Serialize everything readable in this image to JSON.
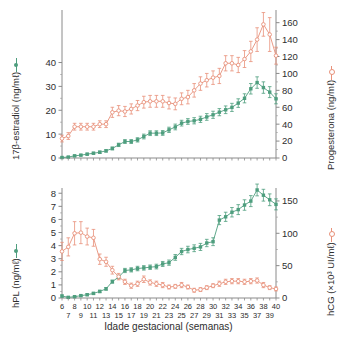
{
  "figure": {
    "xaxis_title": "Idade gestacional (semanas)",
    "x_ticks_even": [
      "6",
      "8",
      "10",
      "12",
      "14",
      "16",
      "18",
      "20",
      "22",
      "24",
      "26",
      "28",
      "30",
      "32",
      "34",
      "36",
      "38",
      "40"
    ],
    "x_ticks_odd": [
      "7",
      "9",
      "11",
      "13",
      "15",
      "17",
      "19",
      "21",
      "23",
      "25",
      "27",
      "29",
      "31",
      "33",
      "35",
      "37",
      "39"
    ],
    "colors": {
      "green": "#4e9e7e",
      "salmon": "#e8917a",
      "axis": "#8a8a8a",
      "text": "#2e2e2e",
      "background": "#ffffff"
    }
  },
  "panels": {
    "top": {
      "left_axis_title": "17β-estradiol (ng/mℓ)",
      "left_ticks": [
        "0",
        "10",
        "20",
        "30",
        "40"
      ],
      "right_axis_title": "Progesterona (ng/mℓ)",
      "right_ticks": [
        "0",
        "20",
        "40",
        "60",
        "80",
        "100",
        "120",
        "140",
        "160"
      ]
    },
    "bottom": {
      "left_axis_title": "hPL (ng/mℓ)",
      "left_ticks": [
        "0",
        "1",
        "2",
        "3",
        "4",
        "5",
        "6",
        "7",
        "8"
      ],
      "right_axis_title": "hCG (×10³ UI/mℓ)",
      "right_ticks": [
        "0",
        "50",
        "100",
        "150"
      ]
    }
  },
  "chart_data": [
    {
      "type": "line",
      "id": "top-panel",
      "title": "",
      "xlabel": "Idade gestacional (semanas)",
      "xlim": [
        6,
        40
      ],
      "grid": false,
      "legend": "axis-titles",
      "series": [
        {
          "name": "17β-estradiol (ng/mℓ)",
          "color": "#4e9e7e",
          "axis": "left",
          "ylabel": "17β-estradiol (ng/mℓ)",
          "ylim": [
            0,
            62
          ],
          "x": [
            6,
            7,
            8,
            9,
            10,
            11,
            12,
            13,
            14,
            15,
            16,
            17,
            18,
            19,
            20,
            21,
            22,
            23,
            24,
            25,
            26,
            27,
            28,
            29,
            30,
            31,
            32,
            33,
            34,
            35,
            36,
            37,
            38,
            39,
            40
          ],
          "values": [
            0.2,
            0.4,
            0.9,
            1.2,
            1.6,
            2.0,
            2.4,
            3.0,
            4.0,
            5.5,
            6.9,
            6.9,
            7.6,
            9.0,
            10.4,
            10.4,
            10.5,
            11.8,
            13.0,
            14.6,
            15.3,
            15.6,
            16.2,
            17.2,
            18.1,
            19.2,
            20.2,
            21.2,
            23.0,
            25.0,
            29.0,
            31.6,
            29.5,
            27.6,
            24.8
          ],
          "errors": [
            0.2,
            0.2,
            0.3,
            0.3,
            0.4,
            0.4,
            0.5,
            0.5,
            0.6,
            0.7,
            0.8,
            0.8,
            0.9,
            1.0,
            1.0,
            1.0,
            1.0,
            1.1,
            1.2,
            1.2,
            1.2,
            1.3,
            1.3,
            1.4,
            1.5,
            1.5,
            1.6,
            1.7,
            1.8,
            1.9,
            2.2,
            2.4,
            2.4,
            2.3,
            2.1
          ]
        },
        {
          "name": "Progesterona (ng/mℓ)",
          "color": "#e8917a",
          "axis": "right",
          "ylabel": "Progesterona (ng/mℓ)",
          "ylim": [
            0,
            175
          ],
          "x": [
            6,
            7,
            8,
            9,
            10,
            11,
            12,
            13,
            14,
            15,
            16,
            17,
            18,
            19,
            20,
            21,
            22,
            23,
            24,
            25,
            26,
            27,
            28,
            29,
            30,
            31,
            32,
            33,
            34,
            35,
            36,
            37,
            38,
            39,
            40
          ],
          "values": [
            23,
            26,
            37,
            37,
            37,
            37,
            40,
            40,
            54,
            56,
            55,
            58,
            62,
            66,
            67,
            67,
            67,
            65,
            64,
            70,
            72,
            80,
            88,
            92,
            95,
            97,
            112,
            112,
            110,
            117,
            126,
            140,
            158,
            146,
            121
          ],
          "errors": [
            4,
            4,
            4,
            4,
            4,
            4,
            4,
            4,
            6,
            6,
            6,
            6,
            6,
            7,
            7,
            7,
            7,
            7,
            7,
            7,
            8,
            8,
            8,
            8,
            8,
            9,
            9,
            9,
            9,
            10,
            12,
            14,
            14,
            20,
            10
          ]
        }
      ]
    },
    {
      "type": "line",
      "id": "bottom-panel",
      "title": "",
      "xlabel": "Idade gestacional (semanas)",
      "xlim": [
        6,
        40
      ],
      "grid": false,
      "legend": "axis-titles",
      "series": [
        {
          "name": "hPL (ng/mℓ)",
          "color": "#4e9e7e",
          "axis": "left",
          "ylabel": "hPL (ng/mℓ)",
          "ylim": [
            0,
            8.4
          ],
          "x": [
            6,
            7,
            8,
            9,
            10,
            11,
            12,
            13,
            14,
            15,
            16,
            17,
            18,
            19,
            20,
            21,
            22,
            23,
            24,
            25,
            26,
            27,
            28,
            29,
            30,
            31,
            32,
            33,
            34,
            35,
            36,
            37,
            38,
            39,
            40
          ],
          "values": [
            0.15,
            0.05,
            0.1,
            0.18,
            0.25,
            0.35,
            0.5,
            0.7,
            1.25,
            1.6,
            2.1,
            2.15,
            2.25,
            2.3,
            2.35,
            2.4,
            2.6,
            2.7,
            3.1,
            3.55,
            3.7,
            3.8,
            3.9,
            4.2,
            4.3,
            5.95,
            6.2,
            6.55,
            6.75,
            7.1,
            7.4,
            8.25,
            7.85,
            7.5,
            7.15
          ],
          "errors": [
            0.08,
            0.05,
            0.05,
            0.06,
            0.07,
            0.08,
            0.09,
            0.1,
            0.12,
            0.14,
            0.16,
            0.16,
            0.17,
            0.17,
            0.17,
            0.18,
            0.19,
            0.2,
            0.22,
            0.24,
            0.25,
            0.26,
            0.27,
            0.28,
            0.3,
            0.35,
            0.35,
            0.36,
            0.38,
            0.4,
            0.42,
            0.45,
            0.45,
            0.45,
            0.42
          ]
        },
        {
          "name": "hCG (×10³ UI/mℓ)",
          "color": "#e8917a",
          "axis": "right",
          "ylabel": "hCG (×10³ UI/mℓ)",
          "ylim": [
            0,
            170
          ],
          "x": [
            6,
            7,
            8,
            9,
            10,
            11,
            12,
            13,
            14,
            15,
            16,
            17,
            18,
            19,
            20,
            21,
            22,
            23,
            24,
            25,
            26,
            27,
            28,
            29,
            30,
            31,
            32,
            33,
            34,
            35,
            36,
            37,
            38,
            39,
            40
          ],
          "values": [
            72,
            79,
            100,
            101,
            95,
            93,
            60,
            56,
            43,
            33,
            25,
            19,
            22,
            29,
            24,
            22,
            20,
            17,
            18,
            20,
            17,
            12,
            13,
            16,
            19,
            22,
            25,
            26,
            26,
            25,
            26,
            27,
            20,
            16,
            14
          ],
          "errors": [
            14,
            14,
            18,
            17,
            13,
            13,
            8,
            7,
            6,
            5,
            4,
            4,
            4,
            5,
            4,
            4,
            4,
            3,
            3,
            4,
            3,
            3,
            3,
            3,
            3,
            4,
            4,
            4,
            4,
            4,
            4,
            4,
            4,
            3,
            3
          ]
        }
      ]
    }
  ]
}
